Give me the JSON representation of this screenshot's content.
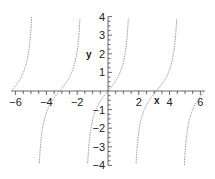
{
  "chart_data": {
    "type": "line",
    "title": "",
    "function": "tan(x)",
    "xlabel": "x",
    "ylabel": "y",
    "xlim": [
      -6.28,
      6.28
    ],
    "ylim": [
      -4,
      4
    ],
    "grid": false,
    "x_ticks": [
      -6,
      -4,
      -2,
      2,
      4,
      6
    ],
    "y_ticks": [
      -4,
      -3,
      -2,
      -1,
      1,
      2,
      3,
      4
    ],
    "series": [
      {
        "name": "tan(x)",
        "color": "#888888",
        "style": "dotted",
        "x_range": [
          -6.28,
          6.28
        ]
      }
    ],
    "asymptotes": [
      -4.712,
      -1.571,
      1.571,
      4.712
    ],
    "sample_points": [
      {
        "x": -6,
        "y": 0.291
      },
      {
        "x": -5,
        "y": 3.381
      },
      {
        "x": -4,
        "y": -1.158
      },
      {
        "x": -3,
        "y": 0.143
      },
      {
        "x": -2,
        "y": 2.185
      },
      {
        "x": -1,
        "y": -1.557
      },
      {
        "x": 0,
        "y": 0
      },
      {
        "x": 1,
        "y": 1.557
      },
      {
        "x": 2,
        "y": -2.185
      },
      {
        "x": 3,
        "y": -0.143
      },
      {
        "x": 4,
        "y": 1.158
      },
      {
        "x": 5,
        "y": -3.381
      },
      {
        "x": 6,
        "y": -0.291
      }
    ]
  },
  "labels": {
    "x_axis": "x",
    "y_axis": "y",
    "x_tick_labels": [
      "−6",
      "−4",
      "−2",
      "2",
      "4",
      "6"
    ],
    "y_tick_labels": [
      "4",
      "3",
      "2",
      "1",
      "−1",
      "−2",
      "−3",
      "−4"
    ]
  }
}
